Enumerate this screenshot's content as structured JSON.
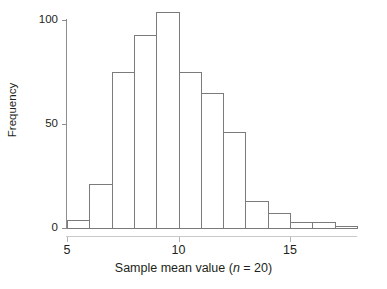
{
  "chart_data": {
    "type": "bar",
    "title": "",
    "subtitle": "",
    "xlabel": "Sample mean value (n = 20)",
    "xlabel_prefix": "Sample mean value (",
    "xlabel_italic": "n",
    "xlabel_suffix": " = 20)",
    "ylabel": "Frequency",
    "bin_width": 1,
    "bin_edges": [
      5,
      6,
      7,
      8,
      9,
      10,
      11,
      12,
      13,
      14,
      15,
      16,
      17,
      18
    ],
    "categories": [
      "5-6",
      "6-7",
      "7-8",
      "8-9",
      "9-10",
      "10-11",
      "11-12",
      "12-13",
      "13-14",
      "14-15",
      "15-16",
      "16-17",
      "17-18"
    ],
    "bin_centers": [
      5.5,
      6.5,
      7.5,
      8.5,
      9.5,
      10.5,
      11.5,
      12.5,
      13.5,
      14.5,
      15.5,
      16.5,
      17.5
    ],
    "values": [
      4,
      21,
      75,
      93,
      104,
      75,
      65,
      46,
      13,
      7,
      3,
      3,
      1
    ],
    "xlim": [
      5,
      18
    ],
    "ylim": [
      0,
      108
    ],
    "x_ticks": [
      5,
      10,
      15
    ],
    "x_tick_labels": [
      "5",
      "10",
      "15"
    ],
    "y_ticks": [
      0,
      50,
      100
    ],
    "y_tick_labels": [
      "0",
      "50",
      "100"
    ],
    "grid": false,
    "legend": false,
    "bar_fill_color": "#ffffff",
    "bar_edge_color": "#7b7b7b",
    "axis_color": "#8d8d8d",
    "text_color": "#231f20",
    "background_color": "#ffffff"
  }
}
